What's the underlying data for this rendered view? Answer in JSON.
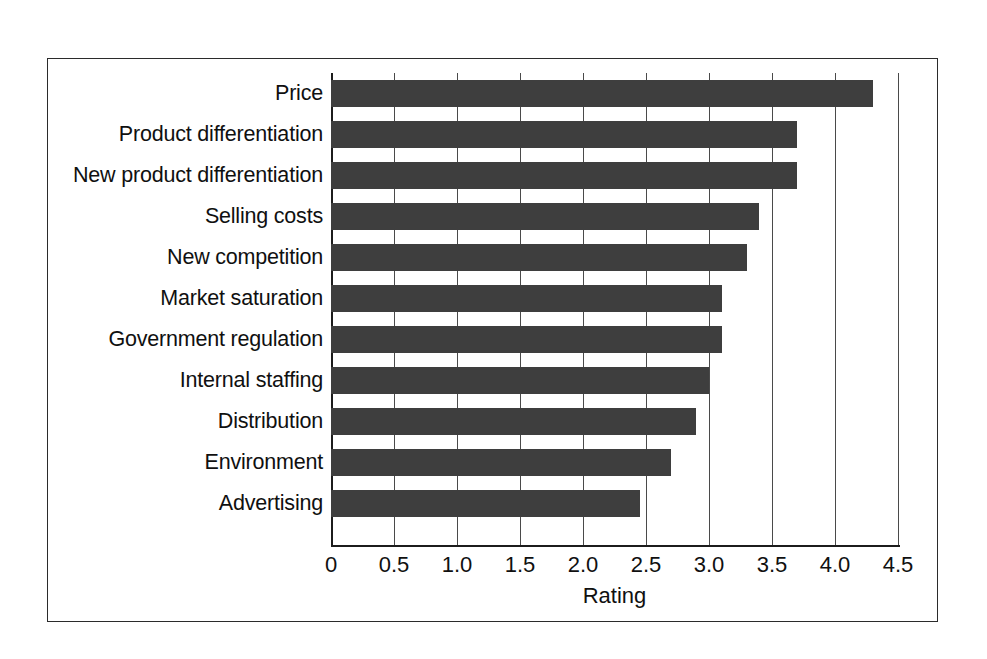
{
  "chart_data": {
    "type": "bar",
    "orientation": "horizontal",
    "title": "",
    "xlabel": "Rating",
    "ylabel": "",
    "xlim": [
      0,
      4.5
    ],
    "xticks": [
      "0",
      "0.5",
      "1.0",
      "1.5",
      "2.0",
      "2.5",
      "3.0",
      "3.5",
      "4.0",
      "4.5"
    ],
    "xtick_values": [
      0,
      0.5,
      1.0,
      1.5,
      2.0,
      2.5,
      3.0,
      3.5,
      4.0,
      4.5
    ],
    "grid": "vertical",
    "legend": "none",
    "bar_color": "#3e3e3e",
    "categories": [
      "Price",
      "Product differentiation",
      "New product differentiation",
      "Selling costs",
      "New competition",
      "Market saturation",
      "Government regulation",
      "Internal staffing",
      "Distribution",
      "Environment",
      "Advertising"
    ],
    "values": [
      4.3,
      3.7,
      3.7,
      3.4,
      3.3,
      3.1,
      3.1,
      3.0,
      2.9,
      2.7,
      2.45
    ]
  }
}
